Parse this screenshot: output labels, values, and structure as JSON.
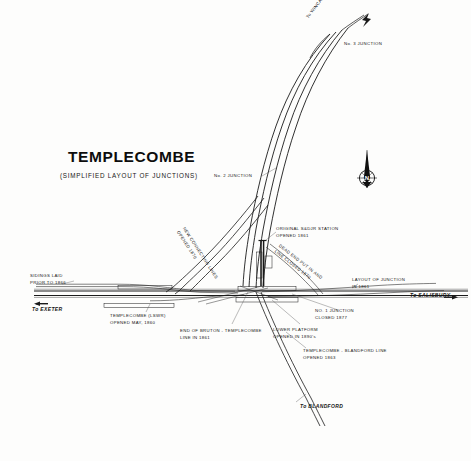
{
  "title": "TEMPLECOMBE",
  "subtitle": "(SIMPLIFIED LAYOUT OF JUNCTIONS)",
  "compass": {
    "name": "north-compass-rose",
    "letter": "N"
  },
  "labels": {
    "to_wincanton": "To WINCANTON",
    "no3_junction": "No. 3 JUNCTION",
    "no2_junction": "No. 2 JUNCTION",
    "original_sdjr_station": "ORIGINAL S&DJR STATION\nOPENED 1861",
    "dead_end": "DEAD END PUT IN AND\nLINE CLOSED 1870",
    "new_connecting_lines": "NEW CONNECTING LINES\nOPENED 1870",
    "sidings_laid": "SIDINGS LAID\nPRIOR TO 1866",
    "to_exeter": "To EXETER",
    "templecombe_lswr": "TEMPLECOMBE (LSWR)\nOPENED MAY, 1860",
    "end_of_bruton": "END OF BRUTON - TEMPLECOMBE\nLINE IN 1861",
    "no1_junction": "NO. 1 JUNCTION\nCLOSED 1877",
    "lower_platform": "LOWER PLATFORM\nOPENED IN 1890's",
    "layout_of_junction": "LAYOUT OF JUNCTION\nIN 1861",
    "to_salisbury": "To SALISBURY",
    "templecombe_blandford": "TEMPLECOMBE - BLANDFORD LINE\nOPENED 1863",
    "to_blandford": "To BLANDFORD"
  },
  "colors": {
    "ink": "#1a1a1a",
    "paper": "#fdfdfc",
    "leader": "#555555"
  }
}
